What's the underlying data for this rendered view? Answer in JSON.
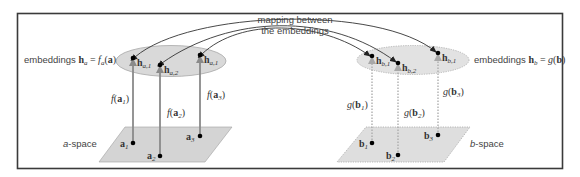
{
  "diagram": {
    "frame": {
      "stroke": "#3a3a3a"
    },
    "colors": {
      "ellipse_fill": "#d9d9d9",
      "plane_fill": "#d4d4d4",
      "arrow_solid": "#8a8a8a",
      "arrow_dotted": "#9a9a9a",
      "arc": "#333333",
      "point": "#000000"
    },
    "mapping_label": {
      "line1": "mapping between",
      "line2": "the embeddings"
    },
    "a_side": {
      "embedding_label": {
        "prefix": "embeddings ",
        "h": "h",
        "h_sub": "a",
        "eq": " = ",
        "f": "f",
        "f_sub": "a",
        "arg_open": "(",
        "arg": "a",
        "arg_close": ")"
      },
      "space_label": {
        "var": "a",
        "rest": "-space"
      },
      "points": [
        {
          "name": "a",
          "sub": "1",
          "emb_sub": "a,1",
          "func": "f",
          "func_label_sub": "1"
        },
        {
          "name": "a",
          "sub": "2",
          "emb_sub": "a,2",
          "func": "f",
          "func_label_sub": "2"
        },
        {
          "name": "a",
          "sub": "3",
          "emb_sub": "a,1",
          "func": "f",
          "func_label_sub": "3"
        }
      ]
    },
    "b_side": {
      "embedding_label": {
        "prefix": "embeddings ",
        "h": "h",
        "h_sub": "b",
        "eq": " = ",
        "g": "g",
        "arg_open": "(",
        "arg": "b",
        "arg_close": ")"
      },
      "space_label": {
        "var": "b",
        "rest": "-space"
      },
      "points": [
        {
          "name": "b",
          "sub": "1",
          "emb_sub": "b,1",
          "func": "g",
          "func_label_sub": "1"
        },
        {
          "name": "b",
          "sub": "2",
          "emb_sub": "b,2",
          "func": "g",
          "func_label_sub": "2"
        },
        {
          "name": "b",
          "sub": "3",
          "emb_sub": "b,1",
          "func": "g",
          "func_label_sub": "3"
        }
      ]
    },
    "h_symbol": "h",
    "paren_open": "(",
    "paren_close": ")"
  }
}
